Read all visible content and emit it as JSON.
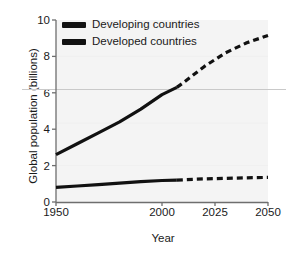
{
  "chart_data": {
    "type": "line",
    "title": "",
    "xlabel": "Year",
    "ylabel": "Global population (billions)",
    "xlim": [
      1950,
      2050
    ],
    "ylim": [
      0,
      10
    ],
    "xticks": [
      "1950",
      "2000",
      "2025",
      "2050"
    ],
    "xtick_values": [
      1950,
      2000,
      2025,
      2050
    ],
    "yticks": [
      "0",
      "2",
      "4",
      "6",
      "8",
      "10"
    ],
    "ytick_values": [
      0,
      2,
      4,
      6,
      8,
      10
    ],
    "grid": "faint horizontal reference line at 6.3",
    "reference_line_value": 6.3,
    "legend_position": "top-left inside plot",
    "plot_background": "#f4f4f4",
    "line_color": "#111111",
    "series": [
      {
        "name": "Developing countries",
        "style_historical": "solid",
        "style_projected": "dashed",
        "split_year": 2007,
        "x": [
          1950,
          1960,
          1970,
          1980,
          1990,
          2000,
          2007,
          2010,
          2020,
          2030,
          2040,
          2050
        ],
        "values": [
          2.6,
          3.2,
          3.8,
          4.4,
          5.1,
          5.9,
          6.3,
          6.55,
          7.45,
          8.2,
          8.75,
          9.15
        ]
      },
      {
        "name": "Developed countries",
        "style_historical": "solid",
        "style_projected": "dashed",
        "split_year": 2007,
        "x": [
          1950,
          1960,
          1970,
          1980,
          1990,
          2000,
          2007,
          2010,
          2020,
          2030,
          2040,
          2050
        ],
        "values": [
          0.8,
          0.88,
          0.96,
          1.04,
          1.12,
          1.18,
          1.2,
          1.22,
          1.27,
          1.3,
          1.33,
          1.35
        ]
      }
    ]
  },
  "legend": {
    "items": [
      {
        "label": "Developing countries"
      },
      {
        "label": "Developed countries"
      }
    ]
  },
  "axes": {
    "x_title": "Year",
    "y_title": "Global population (billions)"
  }
}
